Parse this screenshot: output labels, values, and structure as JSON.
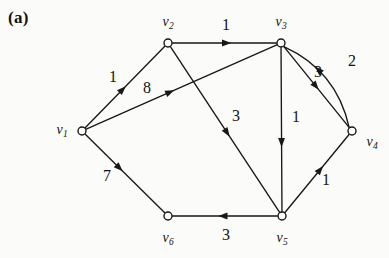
{
  "figure": {
    "panel_label": "(a)",
    "width": 389,
    "height": 258,
    "background": "#fbfbf9",
    "ink_color": "#1a1714"
  },
  "graph": {
    "type": "directed-weighted-graph",
    "nodes": [
      {
        "id": "v1",
        "name": "v",
        "subscript": "1",
        "x": 82,
        "y": 131,
        "label_x": 62,
        "label_y": 130
      },
      {
        "id": "v2",
        "name": "v",
        "subscript": "2",
        "x": 168,
        "y": 43,
        "label_x": 168,
        "label_y": 22
      },
      {
        "id": "v3",
        "name": "v",
        "subscript": "3",
        "x": 281,
        "y": 43,
        "label_x": 281,
        "label_y": 22
      },
      {
        "id": "v4",
        "name": "v",
        "subscript": "4",
        "x": 352,
        "y": 131,
        "label_x": 372,
        "label_y": 142
      },
      {
        "id": "v5",
        "name": "v",
        "subscript": "5",
        "x": 282,
        "y": 216,
        "label_x": 282,
        "label_y": 238
      },
      {
        "id": "v6",
        "name": "v",
        "subscript": "6",
        "x": 168,
        "y": 216,
        "label_x": 168,
        "label_y": 238
      }
    ],
    "edges": [
      {
        "id": "e-v1-v2",
        "from": "v1",
        "to": "v2",
        "weight": "1",
        "label_x": 113,
        "label_y": 77,
        "curved": false,
        "arrow_t": 0.47
      },
      {
        "id": "e-v1-v3",
        "from": "v1",
        "to": "v3",
        "weight": "8",
        "label_x": 147,
        "label_y": 88,
        "curved": false,
        "arrow_t": 0.44
      },
      {
        "id": "e-v1-v6",
        "from": "v1",
        "to": "v6",
        "weight": "7",
        "label_x": 107,
        "label_y": 176,
        "curved": false,
        "arrow_t": 0.43
      },
      {
        "id": "e-v2-v3",
        "from": "v2",
        "to": "v3",
        "weight": "1",
        "label_x": 226,
        "label_y": 25,
        "curved": false,
        "arrow_t": 0.52
      },
      {
        "id": "e-v2-v5",
        "from": "v2",
        "to": "v5",
        "weight": "3",
        "label_x": 236,
        "label_y": 116,
        "curved": false,
        "arrow_t": 0.52
      },
      {
        "id": "e-v3-v4",
        "from": "v3",
        "to": "v4",
        "weight": "3",
        "label_x": 318,
        "label_y": 72,
        "curved": false,
        "arrow_t": 0.49
      },
      {
        "id": "e-v3-v5",
        "from": "v3",
        "to": "v5",
        "weight": "1",
        "label_x": 296,
        "label_y": 117,
        "curved": false,
        "arrow_t": 0.58
      },
      {
        "id": "e-v4-v3",
        "from": "v4",
        "to": "v3",
        "weight": "2",
        "label_x": 352,
        "label_y": 61,
        "curved": true,
        "arrow_t": 0.62
      },
      {
        "id": "e-v5-v4",
        "from": "v5",
        "to": "v4",
        "weight": "1",
        "label_x": 326,
        "label_y": 180,
        "curved": false,
        "arrow_t": 0.55
      },
      {
        "id": "e-v5-v6",
        "from": "v5",
        "to": "v6",
        "weight": "3",
        "label_x": 226,
        "label_y": 235,
        "curved": false,
        "arrow_t": 0.52
      }
    ]
  },
  "chart_data": {
    "type": "diagram",
    "title": "(a)",
    "vertices": [
      "v1",
      "v2",
      "v3",
      "v4",
      "v5",
      "v6"
    ],
    "directed": true,
    "weighted": true,
    "edge_list": [
      {
        "source": "v1",
        "target": "v2",
        "weight": 1
      },
      {
        "source": "v1",
        "target": "v3",
        "weight": 8
      },
      {
        "source": "v1",
        "target": "v6",
        "weight": 7
      },
      {
        "source": "v2",
        "target": "v3",
        "weight": 1
      },
      {
        "source": "v2",
        "target": "v5",
        "weight": 3
      },
      {
        "source": "v3",
        "target": "v4",
        "weight": 3
      },
      {
        "source": "v3",
        "target": "v5",
        "weight": 1
      },
      {
        "source": "v4",
        "target": "v3",
        "weight": 2
      },
      {
        "source": "v5",
        "target": "v4",
        "weight": 1
      },
      {
        "source": "v5",
        "target": "v6",
        "weight": 3
      }
    ]
  }
}
